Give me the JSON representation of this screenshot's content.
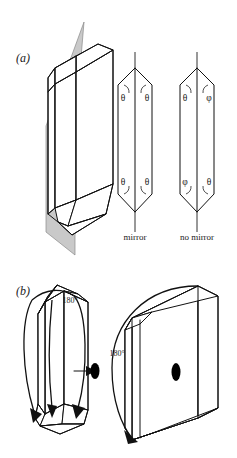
{
  "figure": {
    "background_color": "#ffffff",
    "ink_color": "#111111",
    "mirror_plane_color": "#c9c9c9"
  },
  "panels": [
    {
      "id": "a",
      "label": "(a)",
      "description": "Hexagonal prism with mirror plane; two end-view prisms comparing equal and unequal corner angles",
      "items": [
        {
          "name": "mirror-plane-crystal",
          "type": "3d-prism-with-plane",
          "plane_color": "#c9c9c9"
        },
        {
          "name": "prism-mirror",
          "caption": "mirror",
          "angles": [
            {
              "position": "top-left",
              "symbol": "θ"
            },
            {
              "position": "top-right",
              "symbol": "θ"
            },
            {
              "position": "bottom-left",
              "symbol": "θ"
            },
            {
              "position": "bottom-right",
              "symbol": "θ"
            }
          ]
        },
        {
          "name": "prism-no-mirror",
          "caption": "no mirror",
          "angles": [
            {
              "position": "top-left",
              "symbol": "θ"
            },
            {
              "position": "top-right",
              "symbol": "φ"
            },
            {
              "position": "bottom-left",
              "symbol": "φ"
            },
            {
              "position": "bottom-right",
              "symbol": "θ"
            }
          ]
        }
      ]
    },
    {
      "id": "b",
      "label": "(b)",
      "description": "Two-fold rotation axis: prism rotated 180 degrees and slab face-on with two-fold axis marker",
      "items": [
        {
          "name": "rotation-prism",
          "rotation_label": "180°",
          "axis_symbol": "two-fold-axis-ellipse"
        },
        {
          "name": "rotation-slab",
          "rotation_label": "180°",
          "axis_symbol": "two-fold-axis-ellipse"
        }
      ]
    }
  ],
  "labels": {
    "panel_a": "(a)",
    "panel_b": "(b)",
    "theta": "θ",
    "phi": "φ",
    "mirror": "mirror",
    "no_mirror": "no mirror",
    "rot_left": "180°",
    "rot_right": "180°"
  }
}
